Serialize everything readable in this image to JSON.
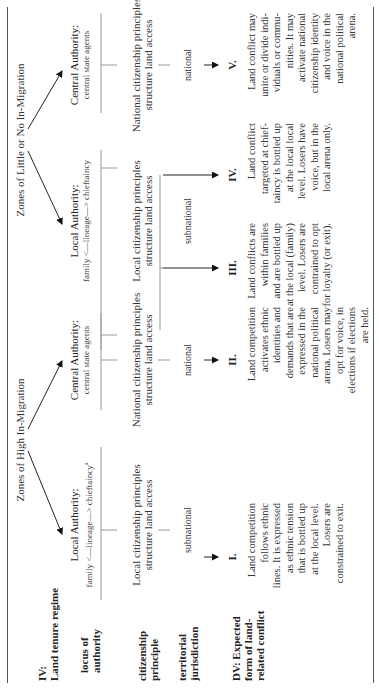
{
  "zones": {
    "high": "Zones of High In-Migration",
    "low": "Zones of Little or No In-Migration"
  },
  "row_labels": {
    "iv": "IV:",
    "land_tenure": "Land tenure regime",
    "locus_1": "locus of",
    "locus_2": "authority",
    "citizenship_1": "citizenship",
    "citizenship_2": "principle",
    "territorial_1": "territorial",
    "territorial_2": "jurisdiction",
    "dv_1": "DV: Expected",
    "dv_2": "form of land-",
    "dv_3": "related conflict"
  },
  "authority": {
    "local_title": "Local Authority:",
    "local_sub": "family <—lineage—> chieftaincy",
    "local_footnote": "a",
    "central_title": "Central Authority:",
    "central_sub": "central state agents"
  },
  "citizenship": {
    "local_1": "Local citizenship principles",
    "local_2": "structure land access",
    "national_1": "National citizenship principles",
    "national_2": "structure land access"
  },
  "jurisdiction": {
    "subnational": "subnational",
    "national": "national"
  },
  "outcomes": [
    {
      "numeral": "I.",
      "lines": [
        "Land competition",
        "follows ethnic",
        "lines. It is expressed",
        "as ethnic tension",
        "that is bottled up",
        "at the local level.",
        "Losers are",
        "constrained to exit."
      ]
    },
    {
      "numeral": "II.",
      "lines": [
        "Land competition",
        "activates ethnic",
        "identities and",
        "demands that are",
        "expressed in the",
        "national political",
        "arena. Losers may",
        "opt for voice, in",
        "elections if elections",
        "are held."
      ]
    },
    {
      "numeral": "III.",
      "lines": [
        "Land conflicts are",
        "within families",
        "and are bottled up",
        "at the local (family)",
        "level. Losers are",
        "contrained to opt",
        "for loyalty (or exit)."
      ]
    },
    {
      "numeral": "IV.",
      "lines": [
        "Land conflict",
        "targeted at chief-",
        "taincy is bottled up",
        "at the local local",
        "level. Losers have",
        "voice, but in the",
        "local arena only."
      ]
    },
    {
      "numeral": "V.",
      "lines": [
        "Land conflict may",
        "unite or divide indi-",
        "viduals or commu-",
        "nities. It may",
        "activate national",
        "citizenship identity",
        "and voice in the",
        "national political",
        "arena."
      ]
    }
  ]
}
